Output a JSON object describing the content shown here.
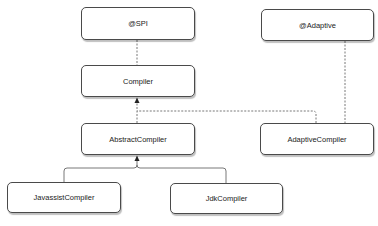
{
  "diagram": {
    "type": "class-hierarchy",
    "nodes": [
      {
        "id": "spi",
        "label": "@SPI"
      },
      {
        "id": "compiler",
        "label": "Compiler"
      },
      {
        "id": "abstract_compiler",
        "label": "AbstractCompiler"
      },
      {
        "id": "adaptive",
        "label": "@Adaptive"
      },
      {
        "id": "adaptive_compiler",
        "label": "AdaptiveCompiler"
      },
      {
        "id": "javassist_compiler",
        "label": "JavassistCompiler"
      },
      {
        "id": "jdk_compiler",
        "label": "JdkCompiler"
      }
    ],
    "edges": [
      {
        "from": "spi",
        "to": "compiler",
        "style": "dashed",
        "arrow": "none"
      },
      {
        "from": "abstract_compiler",
        "to": "compiler",
        "style": "dashed",
        "arrow": "filled"
      },
      {
        "from": "adaptive_compiler",
        "to": "compiler",
        "style": "dashed",
        "arrow": "filled"
      },
      {
        "from": "adaptive",
        "to": "adaptive_compiler",
        "style": "dashed",
        "arrow": "none"
      },
      {
        "from": "javassist_compiler",
        "to": "abstract_compiler",
        "style": "solid",
        "arrow": "filled"
      },
      {
        "from": "jdk_compiler",
        "to": "abstract_compiler",
        "style": "solid",
        "arrow": "filled"
      }
    ],
    "colors": {
      "border": "#4a4a4a",
      "line": "#555555",
      "text": "#222222",
      "background": "#ffffff"
    }
  }
}
